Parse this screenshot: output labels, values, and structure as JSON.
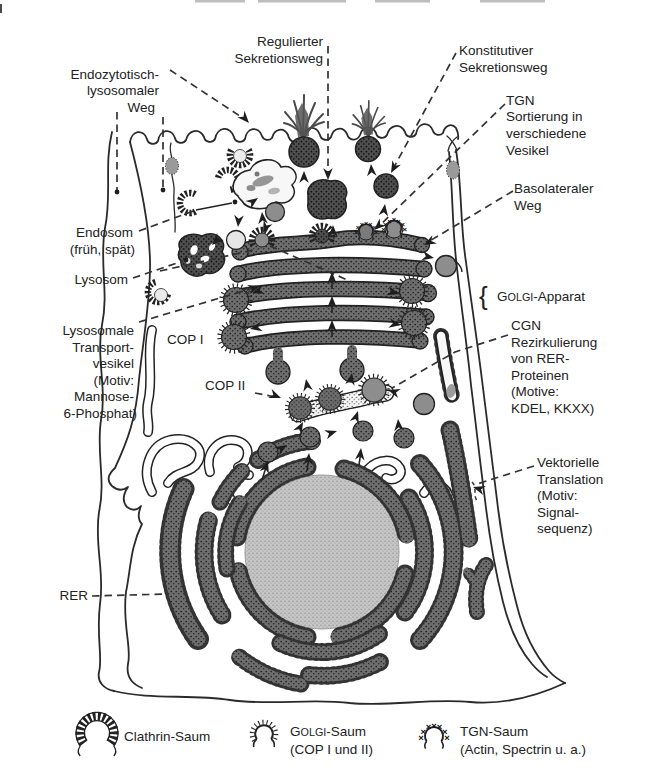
{
  "colors": {
    "ink": "#222222",
    "organelle_fill": "#6e6e6e",
    "granule_fill": "#525252",
    "nucleus_fill": "#c6c6c6",
    "vesicle_gray": "#8d8d8d",
    "cgn_fill": "#f8f8f8",
    "background": "#ffffff"
  },
  "glyphs": {
    "x_mark": "×",
    "brace": "{"
  },
  "diagram": {
    "pathway_labels": {
      "endocytic": [
        "Endozytotisch-",
        "lysosomaler",
        "Weg"
      ],
      "regulated": [
        "Regulierter",
        "Sekretionsweg"
      ],
      "constitutive": [
        "Konstitutiver",
        "Sekretionsweg"
      ],
      "tgn_sorting": [
        "TGN",
        "Sortierung in",
        "verschiedene",
        "Vesikel"
      ],
      "basolateral": [
        "Basolateraler",
        "Weg"
      ]
    },
    "organelle_labels": {
      "endosome": [
        "Endosom",
        "(früh, spät)"
      ],
      "lysosome": "Lysosom",
      "golgi_cap": "G",
      "golgi_smallcaps": "OLGI",
      "golgi_rest": "-Apparat",
      "lysosomal_vesicles": [
        "Lysosomale",
        "Transport-",
        "vesikel",
        "(Motiv:",
        "Mannose-",
        "6-Phosphat)"
      ],
      "cop1": "COP I",
      "cop2": "COP II",
      "cgn_block": [
        "CGN",
        "Rezirkulierung",
        "von RER-",
        "Proteinen",
        "(Motive:",
        "KDEL, KKXX)"
      ],
      "vectorial": [
        "Vektorielle",
        "Translation",
        "(Motiv:",
        "Signal-",
        "sequenz)"
      ],
      "rer": "RER"
    }
  },
  "legend": {
    "clathrin": {
      "icon": "clathrin-coat-icon",
      "label": "Clathrin-Saum"
    },
    "golgi_coat": {
      "icon": "golgi-coat-icon",
      "cap": "G",
      "smallcaps": "OLGI",
      "rest": "-Saum",
      "sub": "(COP I und II)"
    },
    "tgn_coat": {
      "icon": "tgn-coat-icon",
      "label": "TGN-Saum",
      "sub": "(Actin, Spectrin u. a.)"
    }
  }
}
